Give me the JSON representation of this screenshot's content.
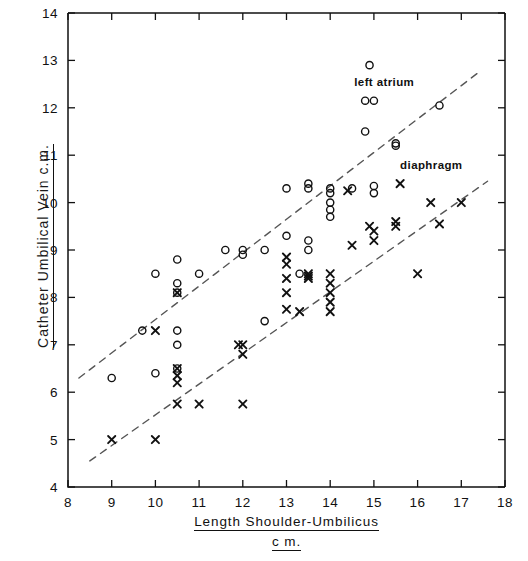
{
  "chart_data": {
    "type": "scatter",
    "title": "",
    "xlabel": "Length Shoulder-Umbilicus",
    "xlabel_line2": "c m.",
    "ylabel": "Catheter Umbilical Vein c.m.",
    "xlim": [
      8,
      18
    ],
    "ylim": [
      4,
      14
    ],
    "xticks": [
      8,
      9,
      10,
      11,
      12,
      13,
      14,
      15,
      16,
      17,
      18
    ],
    "yticks": [
      4,
      5,
      6,
      7,
      8,
      9,
      10,
      11,
      12,
      13,
      14
    ],
    "xtick_labels": [
      "8",
      "9",
      "10",
      "11",
      "12",
      "13",
      "14",
      "15",
      "16",
      "17",
      "18"
    ],
    "ytick_labels": [
      "4",
      "5",
      "6",
      "7",
      "8",
      "9",
      "10",
      "11",
      "12",
      "13",
      "14"
    ],
    "grid": false,
    "legend": "inline-annotations",
    "series": [
      {
        "name": "left atrium",
        "marker": "circle",
        "color": "#111111",
        "points": [
          [
            9.0,
            6.3
          ],
          [
            9.7,
            7.3
          ],
          [
            10.0,
            8.5
          ],
          [
            10.0,
            6.4
          ],
          [
            10.5,
            8.8
          ],
          [
            10.5,
            8.3
          ],
          [
            10.5,
            8.1
          ],
          [
            10.5,
            7.3
          ],
          [
            10.5,
            7.0
          ],
          [
            10.5,
            6.5
          ],
          [
            11.0,
            8.5
          ],
          [
            11.6,
            9.0
          ],
          [
            12.0,
            9.0
          ],
          [
            12.0,
            8.9
          ],
          [
            12.5,
            9.0
          ],
          [
            12.5,
            7.5
          ],
          [
            13.0,
            10.3
          ],
          [
            13.0,
            9.3
          ],
          [
            13.3,
            8.5
          ],
          [
            13.5,
            10.4
          ],
          [
            13.5,
            10.3
          ],
          [
            13.5,
            9.2
          ],
          [
            13.5,
            9.0
          ],
          [
            14.0,
            10.3
          ],
          [
            14.0,
            10.2
          ],
          [
            14.0,
            10.0
          ],
          [
            14.0,
            9.85
          ],
          [
            14.0,
            9.7
          ],
          [
            14.5,
            10.3
          ],
          [
            14.8,
            12.15
          ],
          [
            14.8,
            11.5
          ],
          [
            15.0,
            12.15
          ],
          [
            15.0,
            10.35
          ],
          [
            15.0,
            10.2
          ],
          [
            15.5,
            11.25
          ],
          [
            15.5,
            11.2
          ],
          [
            14.9,
            12.9
          ],
          [
            16.5,
            12.05
          ]
        ]
      },
      {
        "name": "diaphragm",
        "marker": "cross",
        "color": "#111111",
        "points": [
          [
            9.0,
            5.0
          ],
          [
            10.0,
            5.0
          ],
          [
            10.0,
            7.3
          ],
          [
            10.5,
            8.1
          ],
          [
            10.5,
            6.5
          ],
          [
            10.5,
            6.35
          ],
          [
            10.5,
            6.2
          ],
          [
            10.5,
            5.75
          ],
          [
            11.0,
            5.75
          ],
          [
            11.9,
            7.0
          ],
          [
            12.0,
            7.0
          ],
          [
            12.0,
            6.8
          ],
          [
            12.0,
            5.75
          ],
          [
            13.0,
            8.85
          ],
          [
            13.0,
            8.7
          ],
          [
            13.0,
            8.4
          ],
          [
            13.0,
            8.1
          ],
          [
            13.0,
            7.75
          ],
          [
            13.3,
            7.7
          ],
          [
            13.5,
            8.5
          ],
          [
            13.5,
            8.45
          ],
          [
            13.5,
            8.4
          ],
          [
            14.0,
            8.5
          ],
          [
            14.0,
            8.3
          ],
          [
            14.0,
            8.1
          ],
          [
            14.0,
            7.9
          ],
          [
            14.0,
            7.7
          ],
          [
            14.4,
            10.25
          ],
          [
            14.5,
            9.1
          ],
          [
            14.9,
            9.5
          ],
          [
            15.0,
            9.4
          ],
          [
            15.0,
            9.2
          ],
          [
            15.5,
            9.6
          ],
          [
            15.5,
            9.5
          ],
          [
            15.6,
            10.4
          ],
          [
            16.0,
            8.5
          ],
          [
            16.3,
            10.0
          ],
          [
            16.5,
            9.55
          ],
          [
            17.0,
            10.0
          ]
        ]
      }
    ],
    "trendlines": [
      {
        "name": "left atrium",
        "style": "dashed",
        "x0": 8.25,
        "y0": 6.3,
        "x1": 17.4,
        "y1": 12.75
      },
      {
        "name": "diaphragm",
        "style": "dashed",
        "x0": 8.5,
        "y0": 4.55,
        "x1": 17.6,
        "y1": 10.45
      }
    ],
    "annotations": [
      {
        "text": "left atrium",
        "x": 14.55,
        "y": 12.5
      },
      {
        "text": "diaphragm",
        "x": 15.6,
        "y": 10.75
      }
    ]
  },
  "axes": {
    "x_title_line1": "Length  Shoulder-Umbilicus",
    "x_title_line2": "c m.",
    "y_title": "Catheter  Umbilical  Vein  c.m."
  },
  "colors": {
    "axis": "#111111",
    "marker": "#111111",
    "trendline": "#555555",
    "background": "#ffffff"
  }
}
